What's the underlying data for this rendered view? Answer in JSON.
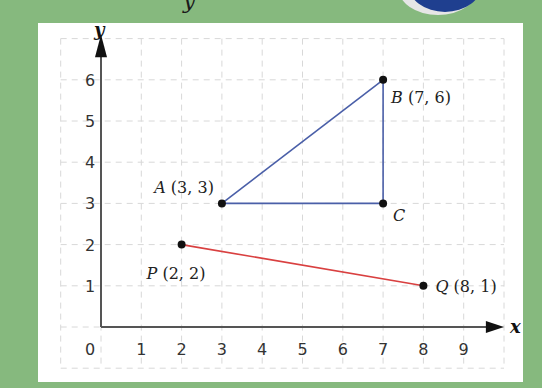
{
  "chart_data": {
    "type": "scatter",
    "title": "",
    "xlabel": "x",
    "ylabel": "y",
    "xlim": [
      0,
      9
    ],
    "ylim": [
      0,
      6
    ],
    "x_ticks": [
      "0",
      "1",
      "2",
      "3",
      "4",
      "5",
      "6",
      "7",
      "8",
      "9"
    ],
    "y_ticks": [
      "1",
      "2",
      "3",
      "4",
      "5",
      "6"
    ],
    "grid": true,
    "points": [
      {
        "name": "A",
        "x": 3,
        "y": 3,
        "label": "A (3, 3)"
      },
      {
        "name": "B",
        "x": 7,
        "y": 6,
        "label": "B (7, 6)"
      },
      {
        "name": "C",
        "x": 7,
        "y": 3,
        "label": "C"
      },
      {
        "name": "P",
        "x": 2,
        "y": 2,
        "label": "P (2, 2)"
      },
      {
        "name": "Q",
        "x": 8,
        "y": 1,
        "label": "Q (8, 1)"
      }
    ],
    "segments": [
      {
        "from": "A",
        "to": "B",
        "color": "#4a5fa8"
      },
      {
        "from": "B",
        "to": "C",
        "color": "#4a5fa8"
      },
      {
        "from": "A",
        "to": "C",
        "color": "#4a5fa8"
      },
      {
        "from": "P",
        "to": "Q",
        "color": "#d94040"
      }
    ]
  },
  "colors": {
    "background": "#86b97e",
    "panel": "#ffffff",
    "triangle": "#4a5fa8",
    "segment_pq": "#d94040",
    "axis": "#555555",
    "grid": "#d8d8d8"
  },
  "labels": {
    "x_axis": "x",
    "y_axis": "y",
    "origin": "0",
    "A": "A",
    "A_coords": "(3, 3)",
    "B": "B",
    "B_coords": "(7, 6)",
    "C": "C",
    "P": "P",
    "P_coords": "(2, 2)",
    "Q": "Q",
    "Q_coords": "(8, 1)"
  }
}
